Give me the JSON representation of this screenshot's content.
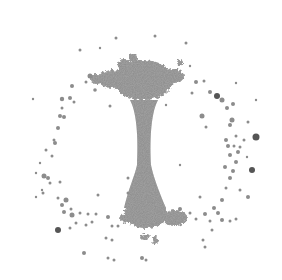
{
  "image": {
    "width": 282,
    "height": 280,
    "background": "#ffffff",
    "subject": "grayscale particle pattern: vertical stalk with dense top and bottom clusters, surrounded by a scattered ring of specks",
    "colors": {
      "stalk": "#8a8a8a",
      "stalk_dark": "#7a7a7a",
      "speck": "#8c8c8c",
      "speck_dark": "#555555"
    },
    "stalk": {
      "top_cluster": {
        "cx": 143,
        "cy": 80,
        "rx": 30,
        "ry": 20
      },
      "top_wings": [
        {
          "cx": 112,
          "cy": 79,
          "rx": 14,
          "ry": 9
        },
        {
          "cx": 174,
          "cy": 76,
          "rx": 10,
          "ry": 7
        },
        {
          "cx": 96,
          "cy": 79,
          "rx": 6,
          "ry": 5
        },
        {
          "cx": 124,
          "cy": 64,
          "rx": 6,
          "ry": 5
        },
        {
          "cx": 133,
          "cy": 58,
          "rx": 4,
          "ry": 4
        },
        {
          "cx": 180,
          "cy": 63,
          "rx": 3,
          "ry": 3
        }
      ],
      "neck": {
        "top_y": 100,
        "bottom_y": 190,
        "center_x": 144,
        "top_half_width": 14,
        "mid_half_width": 6,
        "bottom_half_width": 14
      },
      "bottom_cluster": {
        "cx": 146,
        "cy": 214,
        "rx": 22,
        "ry": 14
      },
      "bottom_wings": [
        {
          "cx": 175,
          "cy": 218,
          "rx": 12,
          "ry": 8
        },
        {
          "cx": 128,
          "cy": 218,
          "rx": 8,
          "ry": 5
        },
        {
          "cx": 145,
          "cy": 237,
          "rx": 4,
          "ry": 3
        },
        {
          "cx": 155,
          "cy": 240,
          "rx": 3,
          "ry": 4
        }
      ]
    },
    "ring": {
      "cx": 144,
      "cy": 160,
      "rx": 112,
      "ry": 100
    },
    "specks": [
      [
        116,
        38,
        1.5
      ],
      [
        155,
        36,
        1.5
      ],
      [
        186,
        43,
        1.5
      ],
      [
        80,
        50,
        1.5
      ],
      [
        100,
        48,
        1.2
      ],
      [
        236,
        83,
        1.2
      ],
      [
        90,
        76,
        2.5
      ],
      [
        86,
        82,
        1.5
      ],
      [
        72,
        86,
        2
      ],
      [
        95,
        90,
        1.8
      ],
      [
        70,
        98,
        2
      ],
      [
        62,
        99,
        2.2
      ],
      [
        33,
        99,
        1.2
      ],
      [
        64,
        117,
        2
      ],
      [
        62,
        108,
        1.5
      ],
      [
        110,
        106,
        1.5
      ],
      [
        166,
        105,
        1.2
      ],
      [
        202,
        116,
        2.5
      ],
      [
        217,
        96,
        3
      ],
      [
        222,
        100,
        2.5
      ],
      [
        227,
        108,
        2
      ],
      [
        233,
        104,
        2
      ],
      [
        232,
        120,
        2.5
      ],
      [
        256,
        137,
        3.5
      ],
      [
        236,
        136,
        1.5
      ],
      [
        210,
        92,
        2
      ],
      [
        196,
        82,
        2
      ],
      [
        204,
        81,
        1.5
      ],
      [
        192,
        93,
        1.5
      ],
      [
        230,
        125,
        2
      ],
      [
        248,
        122,
        1.5
      ],
      [
        206,
        127,
        1.5
      ],
      [
        60,
        116,
        2
      ],
      [
        58,
        128,
        2
      ],
      [
        54,
        140,
        1.5
      ],
      [
        46,
        150,
        1.5
      ],
      [
        36,
        173,
        1.2
      ],
      [
        44,
        176,
        2.5
      ],
      [
        48,
        178,
        2
      ],
      [
        50,
        183,
        1.5
      ],
      [
        43,
        193,
        1.5
      ],
      [
        36,
        197,
        1.2
      ],
      [
        60,
        182,
        1.5
      ],
      [
        66,
        200,
        2.5
      ],
      [
        62,
        205,
        2
      ],
      [
        64,
        212,
        2
      ],
      [
        72,
        215,
        2.5
      ],
      [
        80,
        213,
        1.5
      ],
      [
        88,
        214,
        1.5
      ],
      [
        70,
        228,
        1.5
      ],
      [
        76,
        223,
        1.5
      ],
      [
        58,
        230,
        3
      ],
      [
        86,
        225,
        1.5
      ],
      [
        92,
        222,
        1.5
      ],
      [
        108,
        217,
        2
      ],
      [
        112,
        226,
        1.5
      ],
      [
        118,
        226,
        1.5
      ],
      [
        106,
        238,
        1.5
      ],
      [
        112,
        240,
        1.5
      ],
      [
        84,
        253,
        2
      ],
      [
        108,
        258,
        1.5
      ],
      [
        114,
        260,
        1.5
      ],
      [
        142,
        258,
        2
      ],
      [
        146,
        260,
        1.5
      ],
      [
        128,
        193,
        1.5
      ],
      [
        128,
        178,
        1.5
      ],
      [
        180,
        209,
        2
      ],
      [
        190,
        213,
        1.5
      ],
      [
        196,
        219,
        1.5
      ],
      [
        205,
        214,
        2
      ],
      [
        214,
        208,
        2
      ],
      [
        218,
        213,
        2
      ],
      [
        210,
        221,
        1.5
      ],
      [
        222,
        220,
        2
      ],
      [
        230,
        221,
        1.5
      ],
      [
        236,
        219,
        1.5
      ],
      [
        203,
        240,
        1.5
      ],
      [
        205,
        247,
        1.5
      ],
      [
        222,
        200,
        2
      ],
      [
        226,
        188,
        1.5
      ],
      [
        230,
        178,
        2
      ],
      [
        233,
        171,
        2
      ],
      [
        225,
        167,
        2
      ],
      [
        236,
        162,
        2
      ],
      [
        230,
        155,
        2
      ],
      [
        238,
        152,
        2
      ],
      [
        228,
        146,
        2
      ],
      [
        226,
        140,
        2
      ],
      [
        234,
        146,
        1.5
      ],
      [
        240,
        147,
        1.5
      ],
      [
        248,
        197,
        2
      ],
      [
        244,
        140,
        1.5
      ],
      [
        252,
        170,
        3
      ],
      [
        240,
        190,
        1.5
      ],
      [
        247,
        157,
        1.2
      ],
      [
        55,
        143,
        2
      ],
      [
        52,
        156,
        1.5
      ],
      [
        40,
        163,
        1.2
      ],
      [
        42,
        190,
        1.2
      ],
      [
        71,
        209,
        1.5
      ],
      [
        98,
        195,
        1.5
      ],
      [
        96,
        214,
        1.5
      ],
      [
        200,
        197,
        1.5
      ],
      [
        180,
        165,
        1.2
      ],
      [
        212,
        230,
        1.5
      ],
      [
        190,
        66,
        1.2
      ],
      [
        256,
        100,
        1.2
      ],
      [
        74,
        102,
        1.5
      ],
      [
        58,
        198,
        1.5
      ]
    ]
  }
}
